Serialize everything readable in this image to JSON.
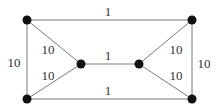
{
  "diagram": {
    "type": "weighted-graph",
    "colors": {
      "edge": "#7a7a7a",
      "node": "#111111",
      "label": "#333333",
      "background": "#ffffff"
    },
    "nodes": [
      {
        "id": "top-left",
        "x": 27,
        "y": 20
      },
      {
        "id": "bottom-left",
        "x": 27,
        "y": 99
      },
      {
        "id": "mid-left",
        "x": 81,
        "y": 64
      },
      {
        "id": "mid-right",
        "x": 139,
        "y": 64
      },
      {
        "id": "top-right",
        "x": 192,
        "y": 20
      },
      {
        "id": "bottom-right",
        "x": 192,
        "y": 99
      }
    ],
    "edges": [
      {
        "from": "top-left",
        "to": "top-right",
        "weight": "1"
      },
      {
        "from": "bottom-left",
        "to": "bottom-right",
        "weight": "1"
      },
      {
        "from": "mid-left",
        "to": "mid-right",
        "weight": "1"
      },
      {
        "from": "top-left",
        "to": "bottom-left",
        "weight": "10"
      },
      {
        "from": "top-right",
        "to": "bottom-right",
        "weight": "10"
      },
      {
        "from": "top-left",
        "to": "mid-left",
        "weight": "10"
      },
      {
        "from": "bottom-left",
        "to": "mid-left",
        "weight": "10"
      },
      {
        "from": "top-right",
        "to": "mid-right",
        "weight": "10"
      },
      {
        "from": "bottom-right",
        "to": "mid-right",
        "weight": "10"
      }
    ]
  }
}
